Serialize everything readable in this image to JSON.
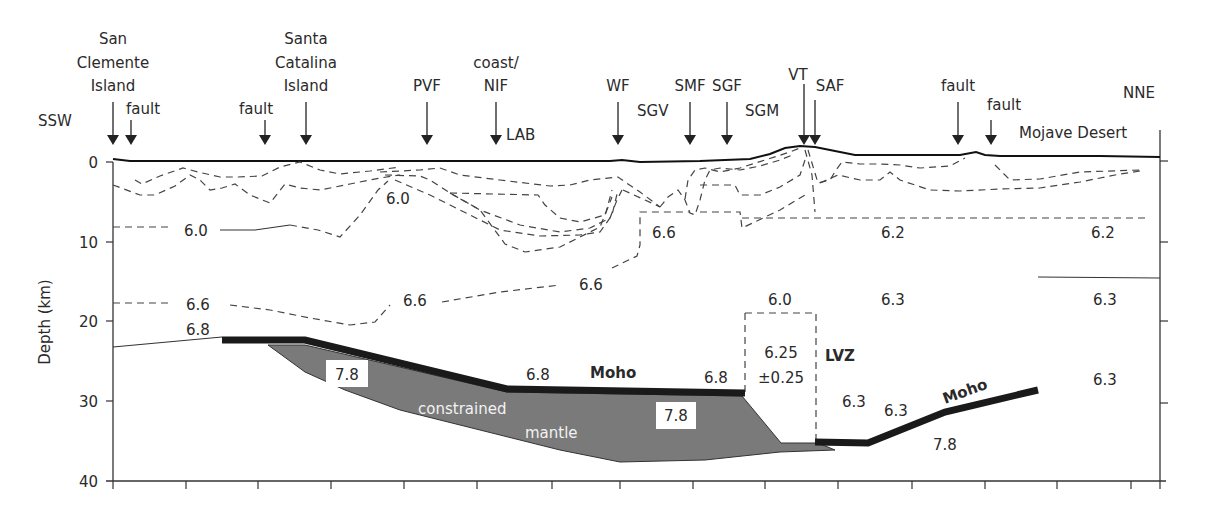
{
  "diagram": {
    "direction_left": "SSW",
    "direction_right": "NNE",
    "y_axis_label": "Depth (km)",
    "y_ticks": [
      "0",
      "10",
      "20",
      "30",
      "40"
    ],
    "surface_markers": [
      {
        "label_lines": [
          "San",
          "Clemente",
          "Island"
        ],
        "x": 113
      },
      {
        "label_lines": [
          "fault"
        ],
        "x": 131
      },
      {
        "label_lines": [
          "fault"
        ],
        "x": 265
      },
      {
        "label_lines": [
          "Santa",
          "Catalina",
          "Island"
        ],
        "x": 306
      },
      {
        "label_lines": [
          "PVF"
        ],
        "x": 427
      },
      {
        "label_lines": [
          "coast/",
          "NIF"
        ],
        "x": 496
      },
      {
        "label_lines": [
          "WF"
        ],
        "x": 618
      },
      {
        "label_lines": [
          "SMF"
        ],
        "x": 690
      },
      {
        "label_lines": [
          "SGF"
        ],
        "x": 727
      },
      {
        "label_lines": [
          "VT"
        ],
        "x": 804
      },
      {
        "label_lines": [
          "SAF"
        ],
        "x": 815
      },
      {
        "label_lines": [
          "fault"
        ],
        "x": 958
      },
      {
        "label_lines": [
          "fault"
        ],
        "x": 991
      }
    ],
    "region_labels": {
      "lab": "LAB",
      "sgv": "SGV",
      "sgm": "SGM",
      "mojave": "Mojave Desert"
    },
    "velocity_labels": [
      {
        "text": "6.0",
        "x": 398,
        "y": 204
      },
      {
        "text": "6.0",
        "x": 200,
        "y": 238
      },
      {
        "text": "6.6",
        "x": 664,
        "y": 238
      },
      {
        "text": "6.2",
        "x": 893,
        "y": 238
      },
      {
        "text": "6.2",
        "x": 1103,
        "y": 238
      },
      {
        "text": "6.6",
        "x": 591,
        "y": 290
      },
      {
        "text": "6.6",
        "x": 198,
        "y": 310
      },
      {
        "text": "6.6",
        "x": 415,
        "y": 306
      },
      {
        "text": "6.0",
        "x": 780,
        "y": 305
      },
      {
        "text": "6.3",
        "x": 893,
        "y": 305
      },
      {
        "text": "6.3",
        "x": 1105,
        "y": 305
      },
      {
        "text": "6.8",
        "x": 198,
        "y": 335
      },
      {
        "text": "6.8",
        "x": 538,
        "y": 380
      },
      {
        "text": "6.8",
        "x": 716,
        "y": 383
      },
      {
        "text": "6.3",
        "x": 854,
        "y": 407
      },
      {
        "text": "6.3",
        "x": 896,
        "y": 416
      },
      {
        "text": "6.3",
        "x": 1105,
        "y": 385
      },
      {
        "text": "7.8",
        "x": 950,
        "y": 450
      }
    ],
    "boxed_velocity_labels": [
      {
        "text": "7.8",
        "x": 349,
        "y": 375
      },
      {
        "text": "7.8",
        "x": 676,
        "y": 415
      }
    ],
    "lvz": {
      "label": "LVZ",
      "value": "6.25",
      "uncertainty": "±0.25"
    },
    "moho_labels": [
      "Moho",
      "Moho"
    ],
    "mantle_label_lines": [
      "constrained",
      "mantle"
    ],
    "colors": {
      "moho": "#1a1a1a",
      "mantle_fill": "#7a7a7a",
      "lines": "#444444",
      "text": "#2a2a2a"
    }
  }
}
